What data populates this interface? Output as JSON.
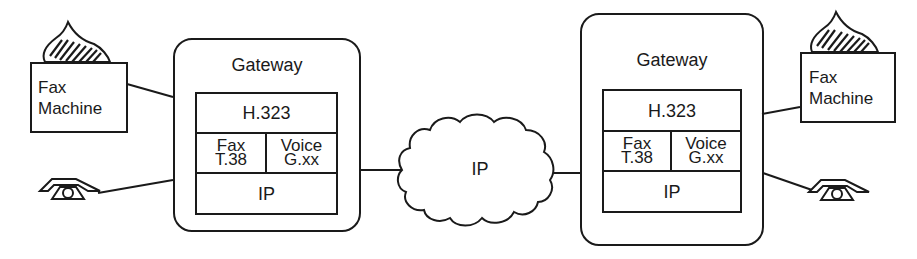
{
  "diagram": {
    "type": "network-architecture",
    "nodes": {
      "left_fax": {
        "label_line1": "Fax",
        "label_line2": "Machine",
        "icon": "fax-paper-icon"
      },
      "left_phone": {
        "icon": "telephone-icon"
      },
      "left_gateway": {
        "title": "Gateway",
        "stack": {
          "top": "H.323",
          "middle_left_line1": "Fax",
          "middle_left_line2": "T.38",
          "middle_right_line1": "Voice",
          "middle_right_line2": "G.xx",
          "bottom": "IP"
        }
      },
      "cloud": {
        "label": "IP"
      },
      "right_gateway": {
        "title": "Gateway",
        "stack": {
          "top": "H.323",
          "middle_left_line1": "Fax",
          "middle_left_line2": "T.38",
          "middle_right_line1": "Voice",
          "middle_right_line2": "G.xx",
          "bottom": "IP"
        }
      },
      "right_fax": {
        "label_line1": "Fax",
        "label_line2": "Machine",
        "icon": "fax-paper-icon"
      },
      "right_phone": {
        "icon": "telephone-icon"
      }
    },
    "edges": [
      {
        "from": "left_fax",
        "to": "left_gateway"
      },
      {
        "from": "left_phone",
        "to": "left_gateway"
      },
      {
        "from": "left_gateway",
        "to": "cloud"
      },
      {
        "from": "cloud",
        "to": "right_gateway"
      },
      {
        "from": "right_gateway",
        "to": "right_fax"
      },
      {
        "from": "right_gateway",
        "to": "right_phone"
      }
    ],
    "colors": {
      "stroke": "#1a1a1a",
      "background": "#ffffff"
    }
  }
}
